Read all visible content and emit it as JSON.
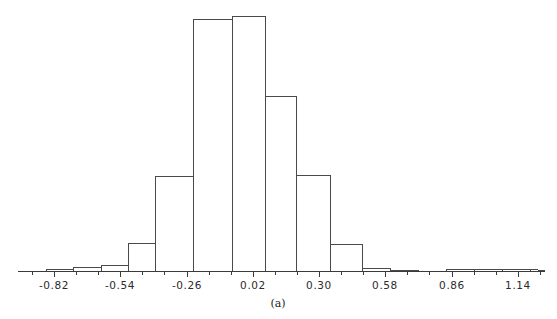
{
  "figure": {
    "caption": "(a)",
    "background": "#ffffff",
    "line_color": "#4a4a4a",
    "axis_color": "#3a3a3a",
    "width": 557,
    "height": 319
  },
  "chart_data": {
    "type": "bar",
    "subtype": "histogram",
    "title": "",
    "xlabel": "",
    "ylabel": "",
    "caption": "(a)",
    "grid": false,
    "legend": null,
    "axis": {
      "baseline_y": 271,
      "x_left": 18,
      "x_right": 545,
      "tick_labels": [
        "-0.82",
        "-0.54",
        "-0.26",
        "0.02",
        "0.30",
        "0.58",
        "0.86",
        "1.14"
      ],
      "tick_values": [
        -0.82,
        -0.54,
        -0.26,
        0.02,
        0.3,
        0.58,
        0.86,
        1.14
      ],
      "tick_label_x": [
        54,
        120,
        187,
        253,
        319,
        385,
        452,
        518
      ],
      "minor_tick_step": 0.1167,
      "xlim": [
        -1.09,
        1.23
      ],
      "ylim": [
        0,
        255
      ]
    },
    "bin_width": 0.1167,
    "bin_edges": [
      -1.09,
      -0.973,
      -0.857,
      -0.74,
      -0.623,
      -0.507,
      -0.39,
      -0.273,
      -0.157,
      -0.04,
      0.077,
      0.193,
      0.31,
      0.427,
      0.543,
      0.66,
      0.777,
      0.893,
      1.01,
      1.127,
      1.243
    ],
    "bin_left_px": [
      18,
      46,
      73,
      101,
      128,
      155,
      183,
      211,
      238,
      266,
      293,
      321,
      348,
      376,
      403,
      431,
      458,
      486,
      513,
      541
    ],
    "counts": [
      0,
      1,
      2,
      3,
      20,
      44,
      105,
      120,
      125,
      94,
      53,
      18,
      4,
      1,
      0,
      1,
      1,
      1,
      1,
      0
    ],
    "bar_top_px": [
      271,
      269,
      267,
      265,
      243,
      209,
      93,
      19,
      16,
      96,
      175,
      244,
      267,
      269,
      271,
      269,
      269,
      269,
      269,
      271
    ],
    "bars": [
      {
        "left_px": 18,
        "right_px": 46,
        "top_px": 271,
        "value": 0
      },
      {
        "left_px": 46,
        "right_px": 73,
        "top_px": 269,
        "value": 1
      },
      {
        "left_px": 73,
        "right_px": 101,
        "top_px": 267,
        "value": 2
      },
      {
        "left_px": 101,
        "right_px": 128,
        "top_px": 265,
        "value": 3
      },
      {
        "left_px": 128,
        "right_px": 155,
        "top_px": 243,
        "value": 20
      },
      {
        "left_px": 155,
        "right_px": 193,
        "top_px": 176,
        "value": 44
      },
      {
        "left_px": 193,
        "right_px": 232,
        "top_px": 19,
        "value": 120
      },
      {
        "left_px": 232,
        "right_px": 265,
        "top_px": 16,
        "value": 125
      },
      {
        "left_px": 265,
        "right_px": 296,
        "top_px": 96,
        "value": 94
      },
      {
        "left_px": 296,
        "right_px": 330,
        "top_px": 175,
        "value": 53
      },
      {
        "left_px": 330,
        "right_px": 362,
        "top_px": 244,
        "value": 18
      },
      {
        "left_px": 362,
        "right_px": 390,
        "top_px": 268,
        "value": 2
      },
      {
        "left_px": 390,
        "right_px": 418,
        "top_px": 270,
        "value": 1
      },
      {
        "left_px": 418,
        "right_px": 446,
        "top_px": 271,
        "value": 0
      },
      {
        "left_px": 446,
        "right_px": 474,
        "top_px": 269,
        "value": 1
      },
      {
        "left_px": 474,
        "right_px": 502,
        "top_px": 269,
        "value": 1
      },
      {
        "left_px": 502,
        "right_px": 530,
        "top_px": 269,
        "value": 1
      }
    ]
  }
}
